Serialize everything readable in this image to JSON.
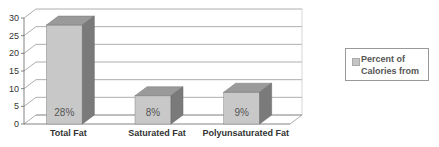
{
  "chart_data": {
    "type": "bar",
    "style": "3d-column",
    "title": "",
    "xlabel": "",
    "ylabel": "",
    "categories": [
      "Total Fat",
      "Saturated Fat",
      "Polyunsaturated Fat"
    ],
    "series": [
      {
        "name": "Percent of Calories from",
        "values": [
          28,
          8,
          9
        ],
        "data_labels": [
          "28%",
          "8%",
          "9%"
        ],
        "color": "#c8c8c8"
      }
    ],
    "ylim": [
      0,
      30
    ],
    "yticks": [
      0,
      5,
      10,
      15,
      20,
      25,
      30
    ],
    "grid": true,
    "legend_position": "right",
    "colors": {
      "bar_front": "#c8c8c8",
      "bar_top": "#9a9a9a",
      "bar_side": "#7a7a7a",
      "grid": "#999999"
    }
  }
}
